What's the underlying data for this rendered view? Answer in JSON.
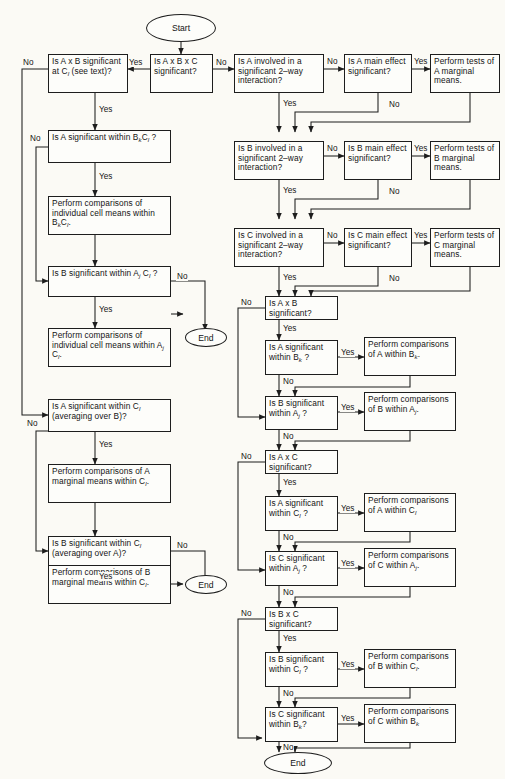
{
  "figure": {
    "type": "flowchart",
    "caption_faint": "",
    "start_label": "Start",
    "end_label": "End",
    "yes_label": "Yes",
    "no_label": "No",
    "line_color": "#1d1d1d",
    "page_color": "#fbfaf5"
  },
  "nodes": {
    "start": "Start",
    "abc": "Is A x B x C significant?",
    "ab_at_cl": "Is A x B significant at C_l (see text)?",
    "a_in_bkcl": "Is A significant within B_kC_l ?",
    "cmp_cells_bkcl": "Perform comparisons of individual cell means within B_kC_l.",
    "b_in_ajcl": "Is B significant within A_j C_l ?",
    "cmp_cells_ajcl": "Perform comparisons of individual cell means within A_j C_l.",
    "a_in_cl_avgB": "Is A significant within C_l (averaging over B)?",
    "cmp_a_marg_cl": "Perform comparisons of A marginal means within C_l.",
    "b_in_cl_avgA": "Is B significant within C_l (averaging over A)?",
    "cmp_b_marg_cl": "Perform comparisons of B marginal means within C_l.",
    "a_involved": "Is A involved in a significant 2-way interaction?",
    "a_main": "Is A main effect significant?",
    "a_marg_tests": "Perform tests of A marginal means.",
    "b_involved": "Is B involved in a significant 2-way interaction?",
    "b_main": "Is B main effect significant?",
    "b_marg_tests": "Perform tests of B marginal means.",
    "c_involved": "Is C involved in a significant 2-way interaction?",
    "c_main": "Is C main effect significant?",
    "c_marg_tests": "Perform tests of C marginal means.",
    "ab_sig": "Is A x B significant?",
    "a_in_bk": "Is A significant within B_k ?",
    "cmp_a_in_bk": "Perform comparisons of A within B_k.",
    "b_in_aj": "Is B significant within A_j ?",
    "cmp_b_in_aj": "Perform comparisons of B within A_j.",
    "ac_sig": "Is A x C significant?",
    "a_in_cl": "Is A significant within C_l ?",
    "cmp_a_in_cl": "Perform comparisons of A within C_l",
    "c_in_aj": "Is C significant within A_j ?",
    "cmp_c_in_aj": "Perform comparisons of C within A_j.",
    "bc_sig": "Is B x C significant?",
    "b_in_cl": "Is B significant within C_l ?",
    "cmp_b_in_cl": "Perform comparisons of B within C_l.",
    "c_in_bk": "Is C significant within B_k?",
    "cmp_c_in_bk": "Perform comparisons of C within B_k",
    "end_left": "End",
    "end_mid": "End",
    "end_bottom": "End"
  },
  "edge_labels": {
    "abc_no": "No",
    "abc_yes": "Yes",
    "ab_at_cl_no": "No",
    "ab_at_cl_yes": "Yes",
    "a_in_bkcl_no": "No",
    "a_in_bkcl_yes": "Yes",
    "b_in_ajcl_no": "No",
    "b_in_ajcl_yes": "Yes",
    "a_in_cl_avgB_no": "No",
    "a_in_cl_avgB_yes": "Yes",
    "b_in_cl_avgA_no": "No",
    "b_in_cl_avgA_yes": "Yes",
    "a_involved_no": "No",
    "a_involved_yes": "Yes",
    "a_main_yes": "Yes",
    "a_main_no": "No",
    "b_involved_no": "No",
    "b_involved_yes": "Yes",
    "b_main_yes": "Yes",
    "b_main_no": "No",
    "c_involved_no": "No",
    "c_involved_yes": "Yes",
    "c_main_yes": "Yes",
    "c_main_no": "No",
    "ab_sig_no": "No",
    "ab_sig_yes": "Yes",
    "a_in_bk_yes": "Yes",
    "a_in_bk_no": "No",
    "b_in_aj_yes": "Yes",
    "b_in_aj_no": "No",
    "ac_sig_no": "No",
    "ac_sig_yes": "Yes",
    "a_in_cl_yes": "Yes",
    "a_in_cl_no": "No",
    "c_in_aj_yes": "Yes",
    "c_in_aj_no": "No",
    "bc_sig_no": "No",
    "bc_sig_yes": "Yes",
    "b_in_cl_yes": "Yes",
    "b_in_cl_no": "No",
    "c_in_bk_yes": "Yes",
    "c_in_bk_no": "No"
  }
}
